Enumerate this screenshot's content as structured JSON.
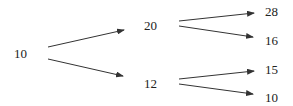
{
  "diagram": {
    "type": "tree",
    "colors": {
      "text": "#222222",
      "edge": "#333333",
      "background": "#ffffff"
    },
    "nodes": [
      {
        "id": "root",
        "label": "10",
        "x": 14,
        "y": 58
      },
      {
        "id": "a",
        "label": "20",
        "x": 144,
        "y": 30
      },
      {
        "id": "b",
        "label": "12",
        "x": 144,
        "y": 88
      },
      {
        "id": "aa",
        "label": "28",
        "x": 265,
        "y": 16
      },
      {
        "id": "ab",
        "label": "16",
        "x": 265,
        "y": 45
      },
      {
        "id": "ba",
        "label": "15",
        "x": 265,
        "y": 74
      },
      {
        "id": "bb",
        "label": "10",
        "x": 265,
        "y": 102
      }
    ],
    "edges": [
      {
        "from": "root",
        "to": "a",
        "x1": 48,
        "y1": 47,
        "x2": 124,
        "y2": 30
      },
      {
        "from": "root",
        "to": "b",
        "x1": 48,
        "y1": 59,
        "x2": 123,
        "y2": 76
      },
      {
        "from": "a",
        "to": "aa",
        "x1": 179,
        "y1": 21,
        "x2": 254,
        "y2": 13
      },
      {
        "from": "a",
        "to": "ab",
        "x1": 179,
        "y1": 26,
        "x2": 253,
        "y2": 37
      },
      {
        "from": "b",
        "to": "ba",
        "x1": 179,
        "y1": 79,
        "x2": 254,
        "y2": 71
      },
      {
        "from": "b",
        "to": "bb",
        "x1": 179,
        "y1": 84,
        "x2": 253,
        "y2": 94
      }
    ]
  }
}
